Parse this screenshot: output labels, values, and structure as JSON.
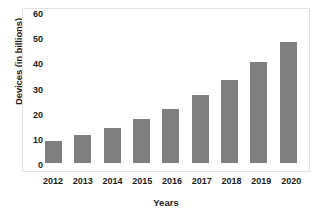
{
  "chart_data": {
    "type": "bar",
    "title": "",
    "xlabel": "Years",
    "ylabel": "Devices (in billions)",
    "categories": [
      "2012",
      "2013",
      "2014",
      "2015",
      "2016",
      "2017",
      "2018",
      "2019",
      "2020"
    ],
    "values": [
      8.7,
      11.2,
      13.8,
      17.3,
      21.5,
      27.0,
      33.0,
      40.0,
      48.0
    ],
    "ylim": [
      0,
      60
    ],
    "yticks": [
      0,
      10,
      20,
      30,
      40,
      50,
      60
    ],
    "ytick_labels": [
      "0",
      "10",
      "20",
      "30",
      "40",
      "50",
      "60"
    ],
    "grid": false,
    "legend": null,
    "series": [
      {
        "name": "Devices",
        "values": [
          8.7,
          11.2,
          13.8,
          17.3,
          21.5,
          27.0,
          33.0,
          40.0,
          48.0
        ]
      }
    ],
    "bar_color": "#7f7f7f",
    "frame_color": "#e2e2e2",
    "background": "#ffffff"
  }
}
